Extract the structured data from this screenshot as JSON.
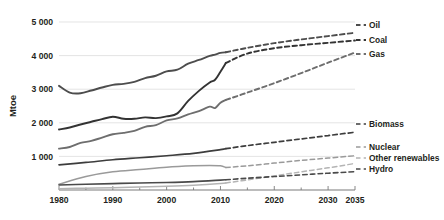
{
  "chart_data": {
    "type": "line",
    "title": "",
    "xlabel": "",
    "ylabel": "Mtoe",
    "xlim": [
      1980,
      2035
    ],
    "ylim": [
      0,
      5000
    ],
    "grid": true,
    "legend_position": "right",
    "x_ticks": [
      "1980",
      "1990",
      "2000",
      "2010",
      "2020",
      "2030",
      "2035"
    ],
    "x_tick_values": [
      1980,
      1990,
      2000,
      2010,
      2020,
      2030,
      2035
    ],
    "y_ticks": [
      "1 000",
      "2 000",
      "3 000",
      "4 000",
      "5 000"
    ],
    "y_tick_values": [
      1000,
      2000,
      3000,
      4000,
      5000
    ],
    "history_end": 2011,
    "note": "Solid segment = historical data, dashed segment = projection",
    "series": [
      {
        "name": "Oil",
        "color": "#4d4d4d",
        "width": 1.9,
        "x": [
          1980,
          1982,
          1984,
          1986,
          1988,
          1990,
          1992,
          1994,
          1996,
          1998,
          2000,
          2002,
          2004,
          2006,
          2008,
          2009,
          2010,
          2011,
          2015,
          2020,
          2025,
          2030,
          2035
        ],
        "values": [
          3100,
          2900,
          2880,
          2960,
          3050,
          3130,
          3160,
          3220,
          3330,
          3400,
          3530,
          3580,
          3760,
          3870,
          3990,
          4030,
          4080,
          4100,
          4230,
          4370,
          4480,
          4580,
          4680
        ]
      },
      {
        "name": "Coal",
        "color": "#333333",
        "width": 1.9,
        "x": [
          1980,
          1982,
          1984,
          1986,
          1988,
          1990,
          1992,
          1994,
          1996,
          1998,
          2000,
          2002,
          2004,
          2006,
          2008,
          2009,
          2010,
          2011,
          2015,
          2020,
          2025,
          2030,
          2035
        ],
        "values": [
          1800,
          1860,
          1950,
          2030,
          2110,
          2180,
          2120,
          2120,
          2160,
          2140,
          2190,
          2280,
          2650,
          2950,
          3200,
          3280,
          3520,
          3780,
          4060,
          4220,
          4310,
          4380,
          4450
        ]
      },
      {
        "name": "Gas",
        "color": "#6e6e6e",
        "width": 1.9,
        "x": [
          1980,
          1982,
          1984,
          1986,
          1988,
          1990,
          1992,
          1994,
          1996,
          1998,
          2000,
          2002,
          2004,
          2006,
          2008,
          2009,
          2010,
          2011,
          2015,
          2020,
          2025,
          2030,
          2035
        ],
        "values": [
          1230,
          1280,
          1400,
          1460,
          1560,
          1660,
          1700,
          1760,
          1880,
          1930,
          2070,
          2130,
          2250,
          2350,
          2480,
          2440,
          2600,
          2680,
          2900,
          3180,
          3480,
          3790,
          4090
        ]
      },
      {
        "name": "Biomass",
        "color": "#3d3d3d",
        "width": 1.7,
        "x": [
          1980,
          1985,
          1990,
          1995,
          2000,
          2005,
          2010,
          2011,
          2015,
          2020,
          2025,
          2030,
          2035
        ],
        "values": [
          750,
          820,
          900,
          960,
          1020,
          1090,
          1200,
          1230,
          1320,
          1420,
          1520,
          1620,
          1720
        ]
      },
      {
        "name": "Nuclear",
        "color": "#9a9a9a",
        "width": 1.5,
        "x": [
          1980,
          1985,
          1990,
          1995,
          2000,
          2005,
          2008,
          2010,
          2011,
          2015,
          2020,
          2025,
          2030,
          2035
        ],
        "values": [
          170,
          400,
          540,
          610,
          680,
          720,
          730,
          720,
          670,
          720,
          800,
          880,
          950,
          1020
        ]
      },
      {
        "name": "Other renewables",
        "color": "#b4b4b4",
        "width": 1.5,
        "x": [
          1980,
          1985,
          1990,
          1995,
          2000,
          2005,
          2010,
          2011,
          2015,
          2020,
          2025,
          2030,
          2035
        ],
        "values": [
          40,
          55,
          70,
          90,
          110,
          140,
          190,
          210,
          300,
          420,
          540,
          660,
          790
        ]
      },
      {
        "name": "Hydro",
        "color": "#4a4a4a",
        "width": 1.6,
        "x": [
          1980,
          1985,
          1990,
          1995,
          2000,
          2005,
          2010,
          2011,
          2015,
          2020,
          2025,
          2030,
          2035
        ],
        "values": [
          150,
          170,
          190,
          210,
          225,
          250,
          295,
          305,
          350,
          400,
          450,
          500,
          545
        ]
      }
    ]
  },
  "legend": {
    "entries": [
      {
        "label": "Oil",
        "y": 28
      },
      {
        "label": "Coal",
        "y": 43
      },
      {
        "label": "Gas",
        "y": 57
      },
      {
        "label": "Biomass",
        "y": 127
      },
      {
        "label": "Nuclear",
        "y": 150
      },
      {
        "label": "Other renewables",
        "y": 161
      },
      {
        "label": "Hydro",
        "y": 172
      }
    ]
  }
}
